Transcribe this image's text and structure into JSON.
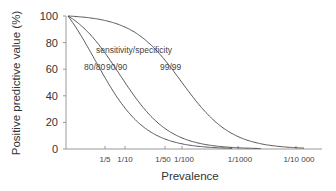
{
  "chart_data": {
    "type": "line",
    "title": "",
    "xlabel": "Prevalence",
    "ylabel": "Positive predictive value (%)",
    "xscale": "log",
    "x_tick_labels": [
      "1/5",
      "1/10",
      "1/50",
      "1/100",
      "1/1000",
      "1/10 000"
    ],
    "x_tick_values": [
      0.2,
      0.1,
      0.02,
      0.01,
      0.001,
      0.0001
    ],
    "y_ticks": [
      0,
      20,
      40,
      60,
      80,
      100
    ],
    "ylim": [
      0,
      100
    ],
    "grid": false,
    "legend_title": "sensitivity/specificity",
    "series": [
      {
        "name": "80/80",
        "sensitivity": 0.8,
        "specificity": 0.8
      },
      {
        "name": "90/90",
        "sensitivity": 0.9,
        "specificity": 0.9
      },
      {
        "name": "99/99",
        "sensitivity": 0.99,
        "specificity": 0.99
      }
    ]
  },
  "labels": {
    "legend_title": "sensitivity/specificity",
    "s1": "80/80",
    "s2": "90/90",
    "s3": "99/99",
    "xlabel": "Prevalence",
    "ylabel": "Positive predictive value (%)",
    "y0": "0",
    "y20": "20",
    "y40": "40",
    "y60": "60",
    "y80": "80",
    "y100": "100",
    "x1": "1/5",
    "x2": "1/10",
    "x3": "1/50",
    "x4": "1/100",
    "x5": "1/1000",
    "x6": "1/10 000"
  }
}
